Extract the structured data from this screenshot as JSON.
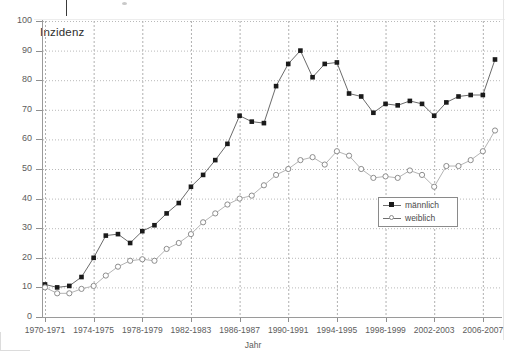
{
  "chart_data": {
    "type": "line",
    "title": "",
    "plot_label": "Inzidenz",
    "xlabel": "Jahr",
    "ylabel": "",
    "ylim": [
      0,
      100
    ],
    "ytick_step": 10,
    "yticks": [
      0,
      10,
      20,
      30,
      40,
      50,
      60,
      70,
      80,
      90,
      100
    ],
    "grid": "both-dotted",
    "legend_position": "inside-right",
    "x_tick_labels": [
      "1970-1971",
      "1974-1975",
      "1978-1979",
      "1982-1983",
      "1986-1987",
      "1990-1991",
      "1994-1995",
      "1998-1999",
      "2002-2003",
      "2006-2007"
    ],
    "x": [
      1970,
      1971,
      1972,
      1973,
      1974,
      1975,
      1976,
      1977,
      1978,
      1979,
      1980,
      1981,
      1982,
      1983,
      1984,
      1985,
      1986,
      1987,
      1988,
      1989,
      1990,
      1991,
      1992,
      1993,
      1994,
      1995,
      1996,
      1997,
      1998,
      1999,
      2000,
      2001,
      2002,
      2003,
      2004,
      2005,
      2006,
      2007
    ],
    "series": [
      {
        "name": "männlich",
        "marker": "filled-square",
        "color": "#1a1a1a",
        "values": [
          11.0,
          10.0,
          10.5,
          13.5,
          20.0,
          27.5,
          28.0,
          25.0,
          29.0,
          31.0,
          35.0,
          38.5,
          44.0,
          48.0,
          53.0,
          58.5,
          68.0,
          66.0,
          65.5,
          78.0,
          85.5,
          90.0,
          81.0,
          85.5,
          86.0,
          75.5,
          74.5,
          69.0,
          72.0,
          71.5,
          73.0,
          72.0,
          68.0,
          72.5,
          74.5,
          75.0,
          75.0,
          87.0
        ]
      },
      {
        "name": "weiblich",
        "marker": "open-circle",
        "color": "#8d8d8d",
        "values": [
          10.0,
          8.0,
          8.0,
          9.5,
          10.5,
          14.0,
          17.0,
          19.0,
          19.5,
          19.0,
          23.0,
          25.0,
          28.0,
          32.0,
          35.0,
          38.0,
          40.0,
          41.0,
          44.5,
          48.0,
          50.0,
          53.0,
          54.0,
          51.5,
          56.0,
          54.5,
          50.0,
          47.0,
          47.5,
          47.0,
          49.5,
          48.0,
          44.0,
          51.0,
          51.0,
          53.0,
          56.0,
          63.0
        ]
      }
    ]
  },
  "legend": {
    "items": [
      {
        "label": "männlich"
      },
      {
        "label": "weiblich"
      }
    ]
  }
}
